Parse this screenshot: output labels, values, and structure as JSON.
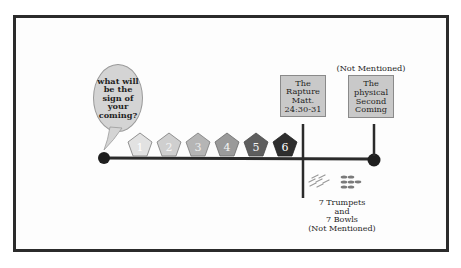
{
  "bubble": {
    "text": "what will be the sign of your coming?"
  },
  "timeline": {
    "signs": [
      {
        "label": "1",
        "fill": "#e2e2e2",
        "text_color": "#ffffff"
      },
      {
        "label": "2",
        "fill": "#cfcfcf",
        "text_color": "#f4f4f4"
      },
      {
        "label": "3",
        "fill": "#b5b5b5",
        "text_color": "#eeeeee"
      },
      {
        "label": "4",
        "fill": "#9a9a9a",
        "text_color": "#f4f4f4"
      },
      {
        "label": "5",
        "fill": "#5e5e5e",
        "text_color": "#f4f4f4"
      },
      {
        "label": "6",
        "fill": "#2e2e2e",
        "text_color": "#ffffff"
      }
    ]
  },
  "events": {
    "rapture": {
      "text": "The\nRapture\nMatt.\n24:30-31"
    },
    "second_coming": {
      "note": "(Not Mentioned)",
      "text": "The\nphysical\nSecond\nComing"
    }
  },
  "judgments": {
    "text": "7 Trumpets\nand\n7 Bowls\n(Not Mentioned)",
    "icons": [
      "trumpets-icon",
      "bowls-icon"
    ]
  }
}
